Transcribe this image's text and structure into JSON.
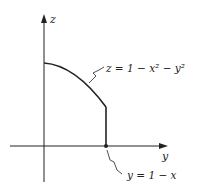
{
  "diagram": {
    "axes": {
      "vertical_label": "z",
      "horizontal_label": "y"
    },
    "annotations": {
      "surface_equation": "z = 1 − x² − y²",
      "boundary_equation": "y = 1 − x"
    },
    "colors": {
      "ink": "#222222",
      "background": "#ffffff"
    }
  }
}
